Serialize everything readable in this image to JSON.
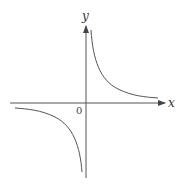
{
  "diagram": {
    "type": "function-graph",
    "axes": {
      "x_label": "x",
      "y_label": "y",
      "origin_label": "0"
    },
    "curves": [
      {
        "name": "branch-quadrant-1",
        "description": "hyperbola branch in first quadrant"
      },
      {
        "name": "branch-quadrant-3",
        "description": "hyperbola branch in third quadrant"
      }
    ],
    "colors": {
      "axis": "#555555",
      "curve": "#555555",
      "background": "#ffffff"
    }
  }
}
